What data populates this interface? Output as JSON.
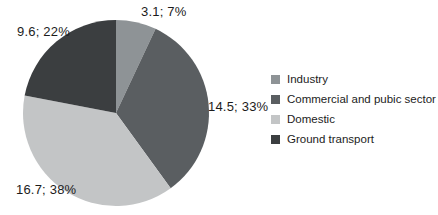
{
  "chart_data": {
    "type": "pie",
    "title": "",
    "start_angle_deg": 0,
    "direction": "clockwise",
    "label_format": "value; percent",
    "legend_position": "right",
    "slices": [
      {
        "name": "Industry",
        "value": 3.1,
        "percent": 7,
        "label": "3.1; 7%",
        "color": "#8e9396"
      },
      {
        "name": "Commercial and pubic sector",
        "value": 14.5,
        "percent": 33,
        "label": "14.5; 33%",
        "color": "#5a5e61"
      },
      {
        "name": "Domestic",
        "value": 16.7,
        "percent": 38,
        "label": "16.7; 38%",
        "color": "#c3c5c6"
      },
      {
        "name": "Ground transport",
        "value": 9.6,
        "percent": 22,
        "label": "9.6; 22%",
        "color": "#3b3e40"
      }
    ]
  },
  "colors": {
    "background": "#ffffff",
    "text": "#1c1c1c"
  }
}
